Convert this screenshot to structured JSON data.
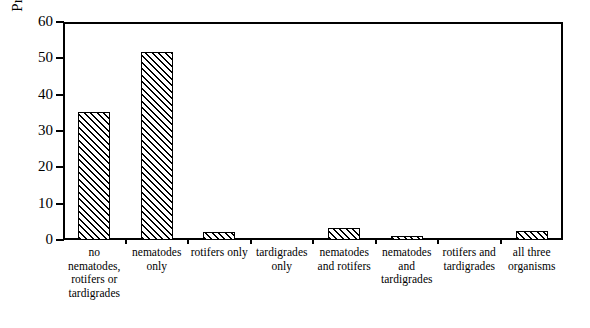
{
  "chart_data": {
    "type": "bar",
    "title": "",
    "xlabel": "",
    "ylabel": "Proportion of samples (%)",
    "ylim": [
      0,
      60
    ],
    "yticks": [
      0,
      10,
      20,
      30,
      40,
      50,
      60
    ],
    "ytick_labels": [
      "0",
      "10",
      "20",
      "30",
      "40",
      "50",
      "60"
    ],
    "grid": false,
    "legend": null,
    "bar_style": {
      "fill": "#ffffff",
      "edge": "#000000",
      "hatch": "diagonal-forward-slash"
    },
    "categories": [
      "no nematodes, rotifers or tardigrades",
      "nematodes only",
      "rotifers only",
      "tardigrades only",
      "nematodes and rotifers",
      "nematodes and tardigrades",
      "rotifers and tardigrades",
      "all three organisms"
    ],
    "category_lines": [
      [
        "no",
        "nematodes,",
        "rotifers or",
        "tardigrades"
      ],
      [
        "nematodes",
        "only"
      ],
      [
        "rotifers only"
      ],
      [
        "tardigrades",
        "only"
      ],
      [
        "nematodes",
        "and rotifers"
      ],
      [
        "nematodes",
        "and",
        "tardigrades"
      ],
      [
        "rotifers and",
        "tardigrades"
      ],
      [
        "all three",
        "organisms"
      ]
    ],
    "values": [
      35.3,
      51.8,
      2.1,
      0.2,
      3.3,
      1.0,
      0.2,
      2.5
    ]
  }
}
